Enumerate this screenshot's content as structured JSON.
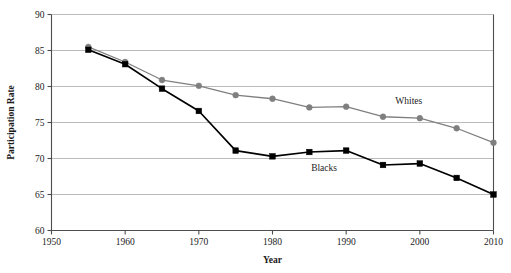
{
  "chart_data": {
    "type": "line",
    "title": "",
    "xlabel": "Year",
    "ylabel": "Participation Rate",
    "x": [
      1955,
      1960,
      1965,
      1970,
      1975,
      1980,
      1985,
      1990,
      1995,
      2000,
      2005,
      2010
    ],
    "xlim": [
      1950,
      2010
    ],
    "ylim": [
      60,
      90
    ],
    "xticks": [
      1950,
      1960,
      1970,
      1980,
      1990,
      2000,
      2010
    ],
    "yticks": [
      60,
      65,
      70,
      75,
      80,
      85,
      90
    ],
    "grid": "horizontal",
    "legend": "inline-annotations",
    "series": [
      {
        "name": "Whites",
        "color": "#7f7f7f",
        "marker": "circle",
        "values": [
          85.5,
          83.4,
          80.9,
          80.1,
          78.8,
          78.3,
          77.1,
          77.2,
          75.8,
          75.6,
          74.2,
          72.2
        ]
      },
      {
        "name": "Blacks",
        "color": "#000000",
        "marker": "square",
        "values": [
          85.1,
          83.1,
          79.7,
          76.6,
          71.1,
          70.3,
          70.9,
          71.1,
          69.1,
          69.3,
          67.3,
          65.0
        ]
      }
    ],
    "annotations": [
      {
        "text": "Whites",
        "x": 1998.5,
        "y": 77.6
      },
      {
        "text": "Blacks",
        "x": 1987.0,
        "y": 68.2
      }
    ]
  }
}
